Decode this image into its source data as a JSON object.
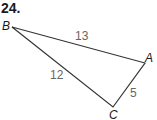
{
  "problem": {
    "number": "24."
  },
  "triangle": {
    "vertices": [
      {
        "name": "B",
        "x": 12,
        "y": 27
      },
      {
        "name": "A",
        "x": 145,
        "y": 63
      },
      {
        "name": "C",
        "x": 113,
        "y": 107
      }
    ],
    "sides": [
      {
        "from": "B",
        "to": "A",
        "length": "13"
      },
      {
        "from": "B",
        "to": "C",
        "length": "12"
      },
      {
        "from": "A",
        "to": "C",
        "length": "5"
      }
    ]
  },
  "colors": {
    "stroke": "#333333",
    "vertex_label": "#1a1a1a",
    "side_label": "#666666"
  }
}
